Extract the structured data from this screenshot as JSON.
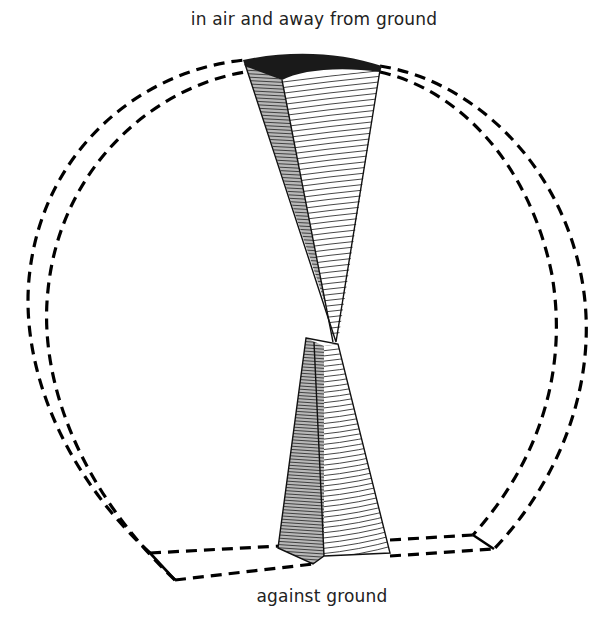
{
  "labels": {
    "top": "in air and away from ground",
    "bottom": "against ground"
  },
  "figure": {
    "colors": {
      "outline": "#000000",
      "shaded_face": "#b8b8b8",
      "light_face": "#ffffff",
      "cap": "#1a1a1a",
      "text": "#222222"
    }
  }
}
